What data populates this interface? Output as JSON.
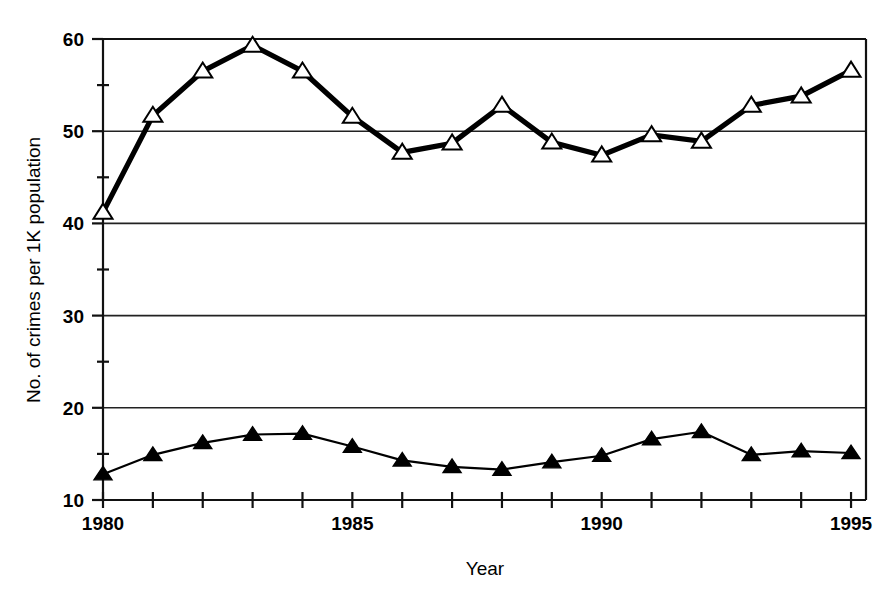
{
  "chart_data": {
    "type": "line",
    "title": "",
    "xlabel": "Year",
    "ylabel": "No. of crimes per 1K population",
    "x": [
      1980,
      1981,
      1982,
      1983,
      1984,
      1985,
      1986,
      1987,
      1988,
      1989,
      1990,
      1991,
      1992,
      1993,
      1994,
      1995
    ],
    "xlim": [
      1980,
      1995.3
    ],
    "ylim": [
      10,
      60
    ],
    "xticks": [
      1980,
      1981,
      1982,
      1983,
      1984,
      1985,
      1986,
      1987,
      1988,
      1989,
      1990,
      1991,
      1992,
      1993,
      1994,
      1995
    ],
    "xticklabels": [
      "1980",
      "",
      "",
      "",
      "",
      "1985",
      "",
      "",
      "",
      "",
      "1990",
      "",
      "",
      "",
      "",
      "1995"
    ],
    "yticks": [
      10,
      20,
      30,
      40,
      50,
      60
    ],
    "yticklabels": [
      "10",
      "20",
      "30",
      "40",
      "50",
      "60"
    ],
    "yminorticks": [
      15,
      25,
      35,
      45,
      55
    ],
    "grid": "horizontal-major",
    "legend": "none",
    "series": [
      {
        "name": "upper-series",
        "marker": "open-triangle",
        "linewidth": "thick",
        "values": [
          41.2,
          51.7,
          56.5,
          59.3,
          56.5,
          51.6,
          47.7,
          48.7,
          52.8,
          48.8,
          47.4,
          49.6,
          48.9,
          52.8,
          53.8,
          56.6
        ]
      },
      {
        "name": "lower-series",
        "marker": "filled-triangle",
        "linewidth": "thin",
        "values": [
          12.8,
          14.9,
          16.2,
          17.1,
          17.2,
          15.8,
          14.3,
          13.6,
          13.3,
          14.1,
          14.8,
          16.6,
          17.4,
          14.9,
          15.3,
          15.1
        ]
      }
    ]
  },
  "axes": {
    "x_title": "Year",
    "y_title": "No. of crimes per 1K population"
  }
}
